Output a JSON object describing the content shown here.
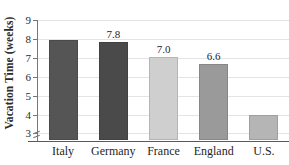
{
  "chart_data": {
    "type": "bar",
    "title": "",
    "xlabel": "",
    "ylabel": "Vacation Time (weeks)",
    "categories": [
      "Italy",
      "Germany",
      "France",
      "England",
      "U.S."
    ],
    "values": [
      7.9,
      7.8,
      7.0,
      6.6,
      3.9
    ],
    "value_labels": [
      "",
      "7.8",
      "7.0",
      "6.6",
      ""
    ],
    "bar_colors": [
      "#555555",
      "#4a4a4a",
      "#cfcfcf",
      "#9a9a9a",
      "#b5b5b5"
    ],
    "ylim": [
      2.6,
      9.0
    ],
    "yticks": [
      3,
      4,
      5,
      6,
      7,
      8,
      9
    ],
    "ytick_labels": [
      "3",
      "4",
      "5",
      "6",
      "7",
      "8",
      "9"
    ],
    "grid": true,
    "grid_axis": "y",
    "axis_break": true,
    "legend": "none",
    "axis_color": "#5a5a5a",
    "grid_color": "#e4e4e4",
    "background": "#ffffff"
  }
}
